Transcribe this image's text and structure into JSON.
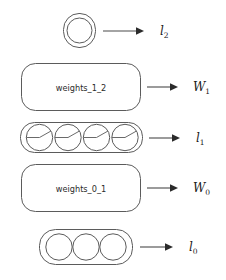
{
  "diagram": {
    "background_color": "#ffffff",
    "stroke_color": "#5b5b5b",
    "text_color": "#2b2b2b",
    "rows": [
      {
        "id": "layer_2",
        "kind": "layer",
        "node_count": 1,
        "node_style": "plain",
        "label_base": "l",
        "label_sub": "2",
        "label_text": "l2"
      },
      {
        "id": "weights_1_2",
        "kind": "weights",
        "box_text": "weights_1_2",
        "label_base": "W",
        "label_sub": "1",
        "label_text": "W1"
      },
      {
        "id": "layer_1",
        "kind": "layer",
        "node_count": 4,
        "node_style": "wedge",
        "label_base": "l",
        "label_sub": "1",
        "label_text": "l1"
      },
      {
        "id": "weights_0_1",
        "kind": "weights",
        "box_text": "weights_0_1",
        "label_base": "W",
        "label_sub": "0",
        "label_text": "W0"
      },
      {
        "id": "layer_0",
        "kind": "layer",
        "node_count": 3,
        "node_style": "plain",
        "label_base": "l",
        "label_sub": "0",
        "label_text": "l0"
      }
    ],
    "labels": {
      "weights_1_2_box": "weights_1_2",
      "weights_0_1_box": "weights_0_1",
      "l2": "l",
      "l2_sub": "2",
      "w1": "W",
      "w1_sub": "1",
      "l1": "l",
      "l1_sub": "1",
      "w0": "W",
      "w0_sub": "0",
      "l0": "l",
      "l0_sub": "0"
    }
  }
}
